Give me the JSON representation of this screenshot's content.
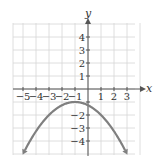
{
  "chart_data": {
    "type": "line",
    "title": "",
    "xlabel": "x",
    "ylabel": "y",
    "xlim": [
      -5.5,
      4
    ],
    "ylim": [
      -5,
      5
    ],
    "grid": true,
    "x_ticks": [
      "-5",
      "-4",
      "-3",
      "-2",
      "-1",
      "1",
      "2",
      "3"
    ],
    "y_ticks": [
      "4",
      "3",
      "2",
      "1",
      "-2",
      "-3",
      "-4"
    ],
    "series": [
      {
        "name": "f(x) = -1/4 (x+1)^2 - 1",
        "color": "#7f7f7f",
        "x": [
          -5,
          -4,
          -3,
          -2,
          -1,
          0,
          1,
          2,
          3
        ],
        "values": [
          -5,
          -3.25,
          -2,
          -1.25,
          -1,
          -1.25,
          -2,
          -3.25,
          -5
        ]
      }
    ],
    "annotations": [
      "arrowheads at both ends of the parabola"
    ]
  }
}
